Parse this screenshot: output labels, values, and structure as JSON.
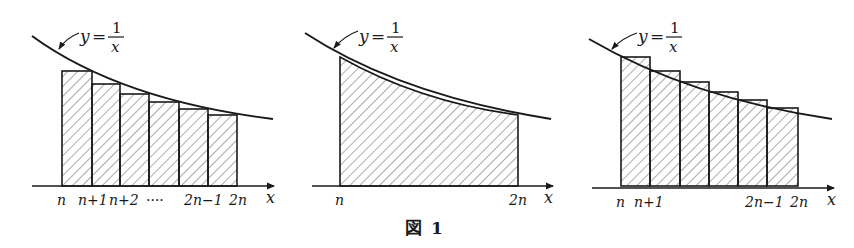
{
  "figure": {
    "caption_kanji": "図",
    "caption_number": "1",
    "stroke_color": "#1a1a1a",
    "hatch_color": "#555555"
  },
  "panels": [
    {
      "id": "left-rectangles",
      "description": "upper sum: rectangles with left-endpoint heights above curve",
      "curve_label": {
        "y": "y",
        "eq": "=",
        "num": "1",
        "den": "x"
      },
      "axis_label": "x",
      "tick_labels": [
        "n",
        "n+1",
        "n+2",
        "····",
        "2n−1",
        "2n"
      ],
      "rect_count": 6
    },
    {
      "id": "middle-integral",
      "description": "area under curve from n to 2n",
      "curve_label": {
        "y": "y",
        "eq": "=",
        "num": "1",
        "den": "x"
      },
      "axis_label": "x",
      "tick_labels": [
        "n",
        "2n"
      ]
    },
    {
      "id": "right-rectangles",
      "description": "rectangles of left-endpoint heights, curve passes through top-left corners",
      "curve_label": {
        "y": "y",
        "eq": "=",
        "num": "1",
        "den": "x"
      },
      "axis_label": "x",
      "tick_labels": [
        "n",
        "n+1",
        "2n−1",
        "2n"
      ],
      "rect_count": 6
    }
  ]
}
